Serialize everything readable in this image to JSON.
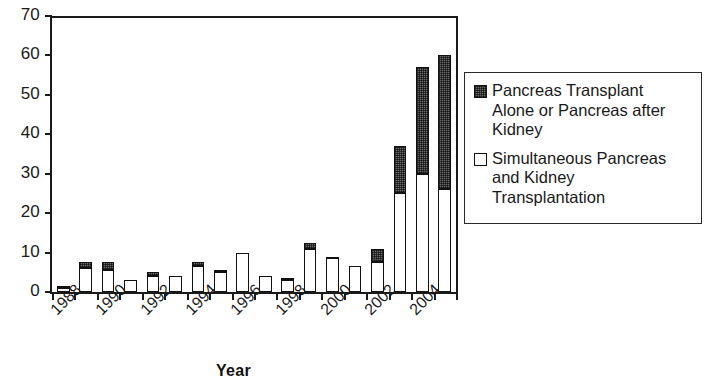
{
  "chart_data": {
    "type": "bar",
    "stacked": true,
    "title": "",
    "xlabel": "Year",
    "ylabel": "",
    "ylim": [
      0,
      70
    ],
    "ytick_values": [
      0,
      10,
      20,
      30,
      40,
      50,
      60,
      70
    ],
    "ytick_labels": [
      "0",
      "10",
      "20",
      "30",
      "40",
      "50",
      "60",
      "70"
    ],
    "grid": false,
    "legend_position": "right",
    "categories": [
      "1988",
      "1989",
      "1990",
      "1991",
      "1992",
      "1993",
      "1994",
      "1995",
      "1996",
      "1997",
      "1998",
      "1999",
      "2000",
      "2001",
      "2002",
      "2003",
      "2004",
      "2005"
    ],
    "xtick_labels_shown": [
      "1988",
      "1990",
      "1992",
      "1994",
      "1996",
      "1998",
      "2000",
      "2002",
      "2004"
    ],
    "series": [
      {
        "name": "Simultaneous Pancreas and Kidney Transplantation",
        "color": "#ffffff",
        "values": [
          1,
          6,
          5.5,
          3,
          4,
          4,
          6.5,
          5,
          10,
          4,
          3,
          11,
          8.5,
          6.5,
          7.5,
          25,
          30,
          26
        ]
      },
      {
        "name": "Pancreas Transplant Alone or Pancreas after Kidney",
        "color": "#6b6b6b",
        "values": [
          0.5,
          1.5,
          2,
          0,
          1,
          0,
          1,
          0.5,
          0,
          0,
          0.5,
          1.5,
          0.5,
          0,
          3.5,
          12,
          27,
          34
        ]
      }
    ],
    "totals": [
      1.5,
      7.5,
      7.5,
      3,
      5,
      4,
      7.5,
      5.5,
      10,
      4,
      3.5,
      12.5,
      9,
      6.5,
      11,
      37,
      57,
      60
    ]
  },
  "legend": {
    "items": [
      {
        "swatch": "dark",
        "label": "Pancreas Transplant\nAlone or Pancreas after\nKidney"
      },
      {
        "swatch": "white",
        "label": "Simultaneous Pancreas\nand Kidney\nTransplantation"
      }
    ]
  },
  "axes": {
    "x_title": "Year"
  }
}
